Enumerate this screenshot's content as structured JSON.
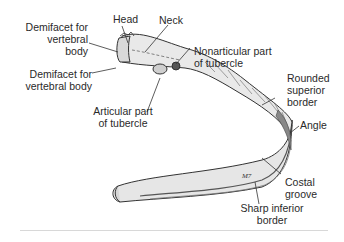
{
  "figure": {
    "labels": {
      "head": "Head",
      "neck": "Neck",
      "demifacet_upper": [
        "Demifacet for",
        "vertebral",
        "body"
      ],
      "demifacet_lower": [
        "Demifacet for",
        "vertebral body"
      ],
      "nonarticular": [
        "Nonarticular part",
        "of tubercle"
      ],
      "articular": [
        "Articular part",
        "of tubercle"
      ],
      "rounded_superior": [
        "Rounded",
        "superior",
        "border"
      ],
      "angle": "Angle",
      "costal_groove": [
        "Costal",
        "groove"
      ],
      "sharp_inferior": [
        "Sharp inferior",
        "border"
      ]
    },
    "signature": "MH",
    "colors": {
      "line": "#333333",
      "bone_fill": "#e8e8e8",
      "bone_shade": "#b5b5b5",
      "rule": "#d8d8d8"
    }
  }
}
